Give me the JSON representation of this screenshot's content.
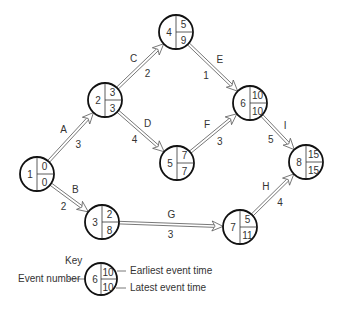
{
  "diagram": {
    "type": "activity-on-arrow network (critical path)",
    "nodes": [
      {
        "id": "1",
        "earliest": "0",
        "latest": "0",
        "x": 37,
        "y": 174
      },
      {
        "id": "2",
        "earliest": "3",
        "latest": "3",
        "x": 105,
        "y": 100
      },
      {
        "id": "3",
        "earliest": "2",
        "latest": "8",
        "x": 102,
        "y": 222
      },
      {
        "id": "4",
        "earliest": "5",
        "latest": "9",
        "x": 176,
        "y": 32
      },
      {
        "id": "5",
        "earliest": "7",
        "latest": "7",
        "x": 177,
        "y": 163
      },
      {
        "id": "6",
        "earliest": "10",
        "latest": "10",
        "x": 250,
        "y": 103
      },
      {
        "id": "7",
        "earliest": "5",
        "latest": "11",
        "x": 240,
        "y": 227
      },
      {
        "id": "8",
        "earliest": "15",
        "latest": "15",
        "x": 306,
        "y": 162
      }
    ],
    "activities": [
      {
        "name": "A",
        "from": "1",
        "to": "2",
        "duration": "3"
      },
      {
        "name": "B",
        "from": "1",
        "to": "3",
        "duration": "2"
      },
      {
        "name": "C",
        "from": "2",
        "to": "4",
        "duration": "2"
      },
      {
        "name": "D",
        "from": "2",
        "to": "5",
        "duration": "4"
      },
      {
        "name": "E",
        "from": "4",
        "to": "6",
        "duration": "1"
      },
      {
        "name": "F",
        "from": "5",
        "to": "6",
        "duration": "3"
      },
      {
        "name": "G",
        "from": "3",
        "to": "7",
        "duration": "3"
      },
      {
        "name": "H",
        "from": "7",
        "to": "8",
        "duration": "4"
      },
      {
        "name": "I",
        "from": "6",
        "to": "8",
        "duration": "5"
      }
    ]
  },
  "key": {
    "title": "Key",
    "event_number_label": "Event number",
    "earliest_label": "Earliest event time",
    "latest_label": "Latest event time",
    "sample_id": "6",
    "sample_earliest": "10",
    "sample_latest": "10"
  }
}
